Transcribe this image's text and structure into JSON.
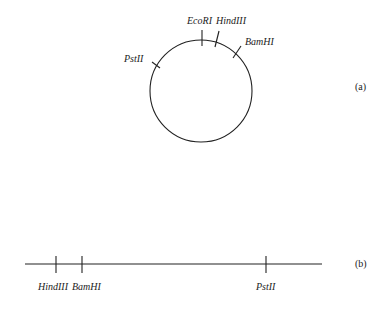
{
  "figure": {
    "panel_a": {
      "tag": "(a)",
      "type": "circular plasmid map",
      "sites": [
        {
          "name": "EcoRI"
        },
        {
          "name": "HindIII"
        },
        {
          "name": "BamHI"
        },
        {
          "name": "PstII"
        }
      ]
    },
    "panel_b": {
      "tag": "(b)",
      "type": "linear map",
      "sites": [
        {
          "name": "HindIII"
        },
        {
          "name": "BamHI"
        },
        {
          "name": "PstII"
        }
      ]
    }
  }
}
